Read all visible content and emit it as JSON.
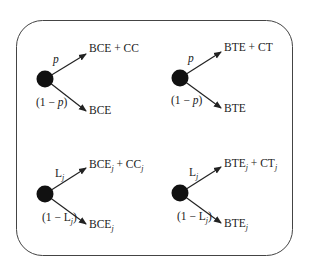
{
  "diagram": {
    "type": "decision-tree-panel",
    "trees": [
      {
        "id": "top-left",
        "upper_branch_prob": "p",
        "lower_branch_prob": "(1 − p)",
        "upper_outcome": "BCE + CC",
        "lower_outcome": "BCE"
      },
      {
        "id": "top-right",
        "upper_branch_prob": "p",
        "lower_branch_prob": "(1 − p)",
        "upper_outcome": "BTE + CT",
        "lower_outcome": "BTE"
      },
      {
        "id": "bottom-left",
        "upper_branch_prob": "L_j",
        "lower_branch_prob": "(1 − L_j)",
        "upper_outcome": "BCE_j + CC_j",
        "lower_outcome": "BCE_j"
      },
      {
        "id": "bottom-right",
        "upper_branch_prob": "L_j",
        "lower_branch_prob": "(1 − L_j)",
        "upper_outcome": "BTE_j + CT_j",
        "lower_outcome": "BTE_j"
      }
    ],
    "colors": {
      "line": "#333333",
      "node": "#111111",
      "background": "#ffffff"
    }
  }
}
